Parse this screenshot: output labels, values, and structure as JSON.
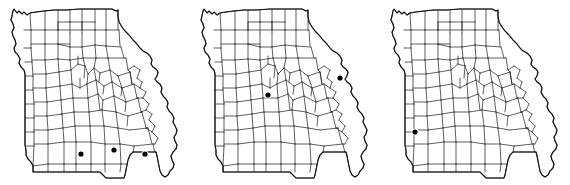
{
  "figure": {
    "type": "distribution-map-series",
    "panel_count": 3,
    "region": "Missouri",
    "subdivision": "counties",
    "background_color": "#ffffff",
    "outline_color": "#111111",
    "county_line_color": "#1a1a1a",
    "dot_color": "#000000",
    "dot_symbol": "filled-circle",
    "dot_radius_px": 2.6
  },
  "panels": [
    {
      "id": "panel-1",
      "x_offset": 0,
      "dot_count": 3,
      "dots": [
        {
          "cx": 81,
          "cy": 154,
          "area": "south-central-border"
        },
        {
          "cx": 114,
          "cy": 150,
          "area": "south-central"
        },
        {
          "cx": 145,
          "cy": 154,
          "area": "southeast-ozarks"
        }
      ]
    },
    {
      "id": "panel-2",
      "x_offset": 190,
      "dot_count": 2,
      "dots": [
        {
          "cx": 268,
          "cy": 95,
          "area": "central"
        },
        {
          "cx": 340,
          "cy": 78,
          "area": "east-st-louis"
        }
      ]
    },
    {
      "id": "panel-3",
      "x_offset": 380,
      "dot_count": 1,
      "dots": [
        {
          "cx": 415,
          "cy": 132,
          "area": "southwest"
        }
      ]
    }
  ]
}
